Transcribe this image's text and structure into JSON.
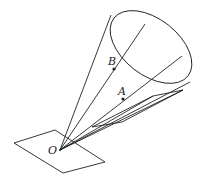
{
  "diagram": {
    "labels": {
      "vertex": "O",
      "point_b": "B",
      "point_a": "A"
    },
    "stroke_color": "#222222",
    "background_color": "#ffffff"
  }
}
